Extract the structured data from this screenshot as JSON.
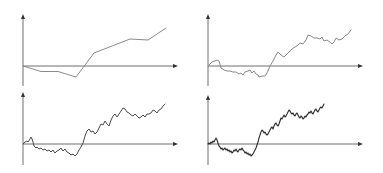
{
  "figure": {
    "colors": {
      "background": "#ffffff",
      "axis": "#6e6e6e",
      "arrowhead": "#333333",
      "path_coarse": "#8a8a8a",
      "path_medium": "#8a8a8a",
      "path_fine": "#4a4a4a",
      "path_finest": "#2e2e2e"
    }
  },
  "chart_data": [
    {
      "type": "line",
      "panel": "top-left",
      "title": "",
      "xlabel": "",
      "ylabel": "",
      "grid": false,
      "legend": null,
      "origin_px": [
        23,
        66
      ],
      "axes_px": {
        "x_end": 178,
        "y_top": 14,
        "y_bottom": 86
      },
      "stroke_width": 1,
      "series": [
        {
          "name": "coarse random walk (8 steps)",
          "points_px": [
            [
              23,
              66
            ],
            [
              41,
              71.5
            ],
            [
              58,
              71.5
            ],
            [
              76,
              77
            ],
            [
              94,
              53
            ],
            [
              130,
              39
            ],
            [
              148,
              40
            ],
            [
              166,
              28
            ]
          ]
        }
      ]
    },
    {
      "type": "line",
      "panel": "top-right",
      "title": "",
      "xlabel": "",
      "ylabel": "",
      "grid": false,
      "legend": null,
      "origin_px": [
        208,
        66
      ],
      "axes_px": {
        "x_end": 363,
        "y_top": 14,
        "y_bottom": 86
      },
      "stroke_width": 1,
      "series": [
        {
          "name": "medium random walk",
          "points_px": [
            [
              208,
              66
            ],
            [
              212,
              62
            ],
            [
              217,
              60
            ],
            [
              219,
              61
            ],
            [
              221,
              68
            ],
            [
              224,
              70
            ],
            [
              227,
              71
            ],
            [
              230,
              71
            ],
            [
              233,
              72
            ],
            [
              236,
              72
            ],
            [
              239,
              74
            ],
            [
              241,
              73
            ],
            [
              243,
              75
            ],
            [
              245,
              72
            ],
            [
              248,
              71
            ],
            [
              250,
              70
            ],
            [
              252,
              73
            ],
            [
              254,
              71
            ],
            [
              256,
              74
            ],
            [
              258,
              75
            ],
            [
              259,
              77
            ],
            [
              262,
              76
            ],
            [
              265,
              76
            ],
            [
              267,
              73
            ],
            [
              270,
              66
            ],
            [
              273,
              61
            ],
            [
              276,
              55
            ],
            [
              278,
              52
            ],
            [
              281,
              55
            ],
            [
              284,
              57
            ],
            [
              286,
              55
            ],
            [
              289,
              52
            ],
            [
              292,
              49
            ],
            [
              295,
              47
            ],
            [
              297,
              46
            ],
            [
              300,
              43
            ],
            [
              303,
              44
            ],
            [
              306,
              40
            ],
            [
              308,
              35
            ],
            [
              311,
              36
            ],
            [
              314,
              38
            ],
            [
              317,
              38
            ],
            [
              320,
              39
            ],
            [
              322,
              37
            ],
            [
              324,
              41
            ],
            [
              327,
              40
            ],
            [
              330,
              42
            ],
            [
              332,
              44
            ],
            [
              334,
              42
            ],
            [
              336,
              38
            ],
            [
              339,
              40
            ],
            [
              342,
              39
            ],
            [
              345,
              36
            ],
            [
              348,
              34
            ],
            [
              351,
              30
            ]
          ]
        }
      ]
    },
    {
      "type": "line",
      "panel": "bottom-left",
      "title": "",
      "xlabel": "",
      "ylabel": "",
      "grid": false,
      "legend": null,
      "origin_px": [
        23,
        144
      ],
      "axes_px": {
        "x_end": 178,
        "y_top": 92,
        "y_bottom": 165
      },
      "stroke_width": 1,
      "series": [
        {
          "name": "fine random walk",
          "points_px": [
            [
              23,
              144
            ],
            [
              25,
              142
            ],
            [
              27,
              141
            ],
            [
              28,
              142
            ],
            [
              30,
              139
            ],
            [
              31,
              137
            ],
            [
              32,
              139
            ],
            [
              33,
              142
            ],
            [
              34,
              146
            ],
            [
              36,
              148
            ],
            [
              37,
              147
            ],
            [
              39,
              149
            ],
            [
              41,
              148
            ],
            [
              43,
              150
            ],
            [
              45,
              149
            ],
            [
              47,
              151
            ],
            [
              49,
              150
            ],
            [
              51,
              152
            ],
            [
              53,
              150
            ],
            [
              55,
              153
            ],
            [
              57,
              151
            ],
            [
              59,
              150
            ],
            [
              61,
              148
            ],
            [
              63,
              151
            ],
            [
              65,
              149
            ],
            [
              67,
              152
            ],
            [
              69,
              153
            ],
            [
              71,
              155
            ],
            [
              73,
              154
            ],
            [
              75,
              156
            ],
            [
              77,
              154
            ],
            [
              79,
              150
            ],
            [
              81,
              147
            ],
            [
              83,
              143
            ],
            [
              85,
              136
            ],
            [
              87,
              131
            ],
            [
              89,
              129
            ],
            [
              91,
              132
            ],
            [
              93,
              131
            ],
            [
              95,
              134
            ],
            [
              97,
              132
            ],
            [
              99,
              128
            ],
            [
              101,
              124
            ],
            [
              103,
              125
            ],
            [
              105,
              121
            ],
            [
              107,
              124
            ],
            [
              109,
              126
            ],
            [
              111,
              120
            ],
            [
              113,
              116
            ],
            [
              115,
              114
            ],
            [
              117,
              117
            ],
            [
              119,
              114
            ],
            [
              121,
              111
            ],
            [
              123,
              108
            ],
            [
              125,
              109
            ],
            [
              127,
              112
            ],
            [
              129,
              113
            ],
            [
              131,
              115
            ],
            [
              133,
              116
            ],
            [
              135,
              114
            ],
            [
              137,
              116
            ],
            [
              139,
              118
            ],
            [
              141,
              117
            ],
            [
              143,
              115
            ],
            [
              145,
              117
            ],
            [
              147,
              114
            ],
            [
              149,
              114
            ],
            [
              151,
              113
            ],
            [
              153,
              110
            ],
            [
              155,
              111
            ],
            [
              157,
              113
            ],
            [
              159,
              110
            ],
            [
              161,
              109
            ],
            [
              163,
              106
            ],
            [
              165,
              104
            ]
          ]
        }
      ]
    },
    {
      "type": "line",
      "panel": "bottom-right",
      "title": "",
      "xlabel": "",
      "ylabel": "",
      "grid": false,
      "legend": null,
      "origin_px": [
        208,
        144
      ],
      "axes_px": {
        "x_end": 363,
        "y_top": 95,
        "y_bottom": 165
      },
      "stroke_width": 1.1,
      "series": [
        {
          "name": "finest random walk (approx. Brownian motion)",
          "points_px": [
            [
              208,
              144
            ],
            [
              209,
              143
            ],
            [
              210,
              144
            ],
            [
              211,
              142
            ],
            [
              212,
              143
            ],
            [
              213,
              141
            ],
            [
              214,
              142
            ],
            [
              215,
              140
            ],
            [
              216,
              138
            ],
            [
              217,
              140
            ],
            [
              218,
              143
            ],
            [
              219,
              146
            ],
            [
              220,
              147
            ],
            [
              221,
              149
            ],
            [
              222,
              148
            ],
            [
              223,
              150
            ],
            [
              224,
              149
            ],
            [
              225,
              148
            ],
            [
              226,
              150
            ],
            [
              227,
              149
            ],
            [
              228,
              151
            ],
            [
              229,
              150
            ],
            [
              230,
              152
            ],
            [
              231,
              151
            ],
            [
              232,
              153
            ],
            [
              233,
              152
            ],
            [
              234,
              150
            ],
            [
              235,
              151
            ],
            [
              236,
              149
            ],
            [
              237,
              151
            ],
            [
              238,
              152
            ],
            [
              239,
              150
            ],
            [
              240,
              149
            ],
            [
              241,
              150
            ],
            [
              242,
              148
            ],
            [
              243,
              150
            ],
            [
              244,
              151
            ],
            [
              245,
              153
            ],
            [
              246,
              152
            ],
            [
              247,
              154
            ],
            [
              248,
              153
            ],
            [
              249,
              155
            ],
            [
              250,
              154
            ],
            [
              251,
              156
            ],
            [
              252,
              155
            ],
            [
              253,
              154
            ],
            [
              254,
              152
            ],
            [
              255,
              150
            ],
            [
              256,
              148
            ],
            [
              257,
              145
            ],
            [
              258,
              142
            ],
            [
              259,
              138
            ],
            [
              260,
              135
            ],
            [
              261,
              132
            ],
            [
              262,
              130
            ],
            [
              263,
              131
            ],
            [
              264,
              133
            ],
            [
              265,
              132
            ],
            [
              266,
              134
            ],
            [
              267,
              135
            ],
            [
              268,
              134
            ],
            [
              269,
              132
            ],
            [
              270,
              130
            ],
            [
              271,
              128
            ],
            [
              272,
              127
            ],
            [
              273,
              129
            ],
            [
              274,
              126
            ],
            [
              275,
              124
            ],
            [
              276,
              123
            ],
            [
              277,
              125
            ],
            [
              278,
              126
            ],
            [
              279,
              124
            ],
            [
              280,
              121
            ],
            [
              281,
              118
            ],
            [
              282,
              119
            ],
            [
              283,
              117
            ],
            [
              284,
              115
            ],
            [
              285,
              117
            ],
            [
              286,
              116
            ],
            [
              287,
              114
            ],
            [
              288,
              112
            ],
            [
              289,
              110
            ],
            [
              290,
              111
            ],
            [
              291,
              113
            ],
            [
              292,
              114
            ],
            [
              293,
              113
            ],
            [
              294,
              115
            ],
            [
              295,
              116
            ],
            [
              296,
              114
            ],
            [
              297,
              113
            ],
            [
              298,
              115
            ],
            [
              299,
              117
            ],
            [
              300,
              118
            ],
            [
              301,
              116
            ],
            [
              302,
              117
            ],
            [
              303,
              119
            ],
            [
              304,
              118
            ],
            [
              305,
              116
            ],
            [
              306,
              117
            ],
            [
              307,
              115
            ],
            [
              308,
              114
            ],
            [
              309,
              112
            ],
            [
              310,
              113
            ],
            [
              311,
              111
            ],
            [
              312,
              113
            ],
            [
              313,
              114
            ],
            [
              314,
              112
            ],
            [
              315,
              110
            ],
            [
              316,
              109
            ],
            [
              317,
              111
            ],
            [
              318,
              112
            ],
            [
              319,
              110
            ],
            [
              320,
              108
            ],
            [
              321,
              107
            ],
            [
              322,
              108
            ],
            [
              323,
              106
            ],
            [
              324,
              104
            ]
          ]
        }
      ]
    }
  ]
}
